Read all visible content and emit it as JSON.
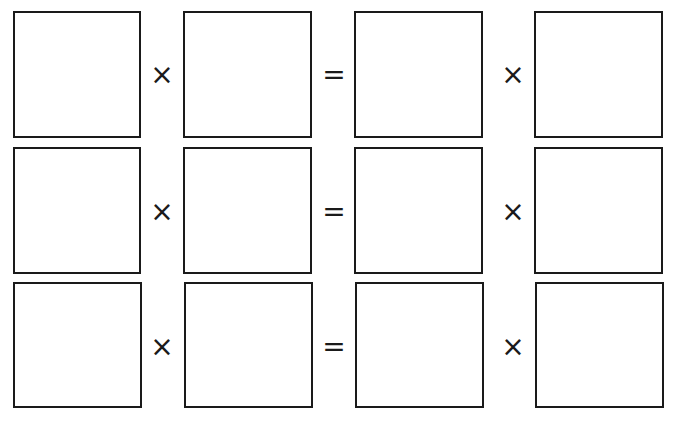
{
  "worksheet": {
    "rows": [
      {
        "left_op": "×",
        "equals": "=",
        "right_op": "×",
        "boxes": [
          "",
          "",
          "",
          ""
        ]
      },
      {
        "left_op": "×",
        "equals": "=",
        "right_op": "×",
        "boxes": [
          "",
          "",
          "",
          ""
        ]
      },
      {
        "left_op": "×",
        "equals": "=",
        "right_op": "×",
        "boxes": [
          "",
          "",
          "",
          ""
        ]
      }
    ],
    "colors": {
      "stroke": "#1a1a1a",
      "background": "#ffffff"
    }
  }
}
